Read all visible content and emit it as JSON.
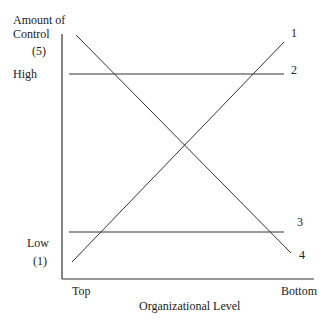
{
  "y_axis": {
    "title_line1": "Amount of",
    "title_line2": "Control",
    "top_value": "(5)",
    "high_label": "High",
    "low_label": "Low",
    "bottom_value": "(1)"
  },
  "x_axis": {
    "left_label": "Top",
    "right_label": "Bottom",
    "title": "Organizational Level"
  },
  "lines": [
    {
      "id": "1",
      "label": "1",
      "description": "rising from low at Top to high at Bottom"
    },
    {
      "id": "2",
      "label": "2",
      "description": "flat high"
    },
    {
      "id": "3",
      "label": "3",
      "description": "flat low"
    },
    {
      "id": "4",
      "label": "4",
      "description": "falling from high at Top to low at Bottom"
    }
  ]
}
